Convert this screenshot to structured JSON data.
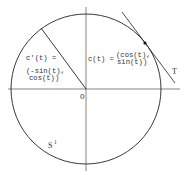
{
  "figure": {
    "colors": {
      "background": "#ffffff",
      "circle": "#222222",
      "axes": "#555555",
      "text": "#333333",
      "point": "#111111"
    },
    "origin_label": "O",
    "circle_label": {
      "base": "S",
      "superscript": "1"
    },
    "position_label": {
      "lhs": "c(t) =",
      "line1": "(cos(t),",
      "line2": "sin(t))"
    },
    "derivative_label": {
      "lhs": "c'(t) =",
      "line1": "(-sin(t),",
      "line2": "cos(t))"
    },
    "tangent_label": "T"
  }
}
